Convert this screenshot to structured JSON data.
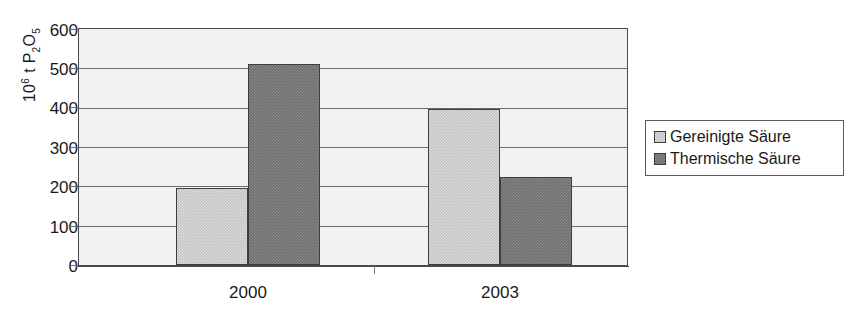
{
  "chart_data": {
    "type": "bar",
    "title": "",
    "subtitle": "",
    "xlabel": "",
    "ylabel": "10^6 t P2O5",
    "ylabel_parts": {
      "base": "10",
      "exponent": "6",
      "unit": "t P",
      "sub1": "2",
      "element": "O",
      "sub2": "5"
    },
    "categories": [
      "2000",
      "2003"
    ],
    "series": [
      {
        "name": "Gereinigte Säure",
        "values": [
          197,
          397
        ],
        "color": "#c3c3c3"
      },
      {
        "name": "Thermische Säure",
        "values": [
          510,
          224
        ],
        "color": "#6e6e6e"
      }
    ],
    "ylim": [
      0,
      600
    ],
    "yticks": [
      600,
      500,
      400,
      300,
      200,
      100,
      0
    ],
    "ytick_labels": [
      "600",
      "500",
      "400",
      "300",
      "200",
      "100",
      "0"
    ],
    "grid": true,
    "grid_axis": "y",
    "legend_position": "right",
    "plot_background": "#f1f1f1",
    "border_color": "#4a4a4a"
  },
  "legend": {
    "items": [
      {
        "label": "Gereinigte Säure",
        "swatch": "legend-swatch-gereinigte-saeure"
      },
      {
        "label": "Thermische Säure",
        "swatch": "legend-swatch-thermische-saeure"
      }
    ]
  },
  "axis": {
    "y_tick_0": "600",
    "y_tick_1": "500",
    "y_tick_2": "400",
    "y_tick_3": "300",
    "y_tick_4": "200",
    "y_tick_5": "100",
    "y_tick_6": "0",
    "x_tick_0": "2000",
    "x_tick_1": "2003"
  }
}
